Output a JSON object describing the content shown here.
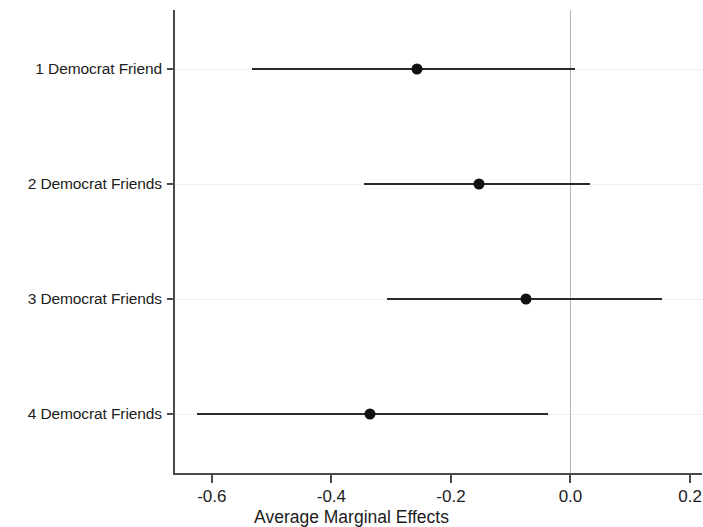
{
  "chart_data": {
    "type": "scatter",
    "subtype": "coefficient-plot",
    "title": "",
    "xlabel": "Average Marginal Effects",
    "ylabel": "",
    "xlim": [
      -0.665,
      0.22
    ],
    "xticks": [
      -0.6,
      -0.4,
      -0.2,
      0.0,
      0.2
    ],
    "xtick_labels": [
      "-0.6",
      "-0.4",
      "-0.2",
      "0.0",
      "0.2"
    ],
    "categories": [
      "1 Democrat Friend",
      "2 Democrat Friends",
      "3 Democrat Friends",
      "4 Democrat Friends"
    ],
    "values": [
      -0.257,
      -0.153,
      -0.075,
      -0.335
    ],
    "ci_low": [
      -0.533,
      -0.346,
      -0.307,
      -0.625
    ],
    "ci_high": [
      0.008,
      0.033,
      0.153,
      -0.037
    ],
    "grid": true,
    "grid_axis": "y",
    "legend": null,
    "reference_line": 0.0,
    "orientation": "horizontal",
    "point_color": "#111111",
    "line_color": "#2a2a2a",
    "axis_color": "#4a4a4a",
    "reference_line_color": "#b6b6b6",
    "gridline_color": "#f0eeee",
    "series": [
      {
        "name": "Average Marginal Effect",
        "points": [
          {
            "category": "1 Democrat Friend",
            "estimate": -0.257,
            "ci_low": -0.533,
            "ci_high": 0.008
          },
          {
            "category": "2 Democrat Friends",
            "estimate": -0.153,
            "ci_low": -0.346,
            "ci_high": 0.033
          },
          {
            "category": "3 Democrat Friends",
            "estimate": -0.075,
            "ci_low": -0.307,
            "ci_high": 0.153
          },
          {
            "category": "4 Democrat Friends",
            "estimate": -0.335,
            "ci_low": -0.625,
            "ci_high": -0.037
          }
        ]
      }
    ]
  }
}
